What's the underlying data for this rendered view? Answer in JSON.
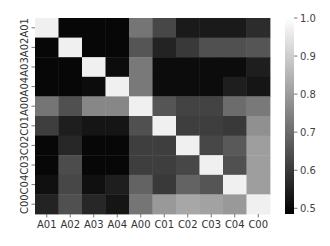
{
  "chart_data": {
    "type": "heatmap",
    "title": "",
    "xlabel": "",
    "ylabel": "",
    "colormap": "gray",
    "vmin": 0.485,
    "vmax": 1.0,
    "x_labels": [
      "A01",
      "A02",
      "A03",
      "A04",
      "A00",
      "C01",
      "C02",
      "C03",
      "C04",
      "C00"
    ],
    "y_labels": [
      "A01",
      "A02",
      "A03",
      "A04",
      "A00",
      "C01",
      "C02",
      "C03",
      "C04",
      "C00"
    ],
    "values": [
      [
        1.0,
        0.49,
        0.49,
        0.49,
        0.73,
        0.63,
        0.53,
        0.53,
        0.53,
        0.57
      ],
      [
        0.49,
        1.0,
        0.49,
        0.49,
        0.66,
        0.55,
        0.6,
        0.65,
        0.65,
        0.66
      ],
      [
        0.49,
        0.49,
        1.0,
        0.5,
        0.74,
        0.5,
        0.5,
        0.5,
        0.5,
        0.54
      ],
      [
        0.49,
        0.49,
        0.5,
        1.0,
        0.74,
        0.5,
        0.5,
        0.5,
        0.54,
        0.52
      ],
      [
        0.73,
        0.65,
        0.77,
        0.77,
        1.0,
        0.66,
        0.62,
        0.62,
        0.71,
        0.74
      ],
      [
        0.61,
        0.54,
        0.52,
        0.52,
        0.65,
        1.0,
        0.61,
        0.61,
        0.6,
        0.79
      ],
      [
        0.49,
        0.56,
        0.49,
        0.49,
        0.61,
        0.61,
        1.0,
        0.63,
        0.67,
        0.82
      ],
      [
        0.49,
        0.64,
        0.49,
        0.49,
        0.61,
        0.61,
        0.63,
        1.0,
        0.65,
        0.82
      ],
      [
        0.51,
        0.63,
        0.51,
        0.54,
        0.69,
        0.6,
        0.69,
        0.66,
        1.0,
        0.82
      ],
      [
        0.55,
        0.65,
        0.56,
        0.52,
        0.73,
        0.81,
        0.84,
        0.83,
        0.81,
        1.0
      ]
    ],
    "colorbar": {
      "ticks": [
        0.5,
        0.6,
        0.7,
        0.8,
        0.9,
        1.0
      ],
      "tick_labels": [
        "0.5",
        "0.6",
        "0.7",
        "0.8",
        "0.9",
        "1.0"
      ],
      "placement": "right"
    }
  }
}
